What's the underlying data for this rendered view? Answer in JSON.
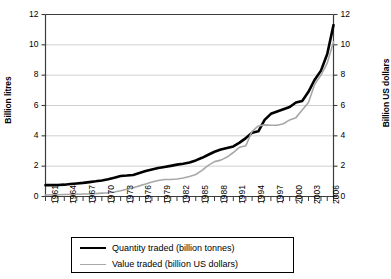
{
  "chart_data": {
    "type": "line",
    "title": "",
    "xlabel": "",
    "ylabel": "Billion litres",
    "ylabel_right": "Billion US dollars",
    "ylim": [
      0,
      12
    ],
    "ylim_right": [
      0,
      12
    ],
    "yticks": [
      0,
      2,
      4,
      6,
      8,
      10,
      12
    ],
    "yticks_right": [
      0,
      2,
      4,
      6,
      8,
      10,
      12
    ],
    "grid": true,
    "grid_axis": "y",
    "legend_position": "bottom",
    "x": [
      1961,
      1962,
      1963,
      1964,
      1965,
      1966,
      1967,
      1968,
      1969,
      1970,
      1971,
      1972,
      1973,
      1974,
      1975,
      1976,
      1977,
      1978,
      1979,
      1980,
      1981,
      1982,
      1983,
      1984,
      1985,
      1986,
      1987,
      1988,
      1989,
      1990,
      1991,
      1992,
      1993,
      1994,
      1995,
      1996,
      1997,
      1998,
      1999,
      2000,
      2001,
      2002,
      2003,
      2004,
      2005,
      2006,
      2007
    ],
    "xtick_labels": [
      "1961",
      "1964",
      "1967",
      "1970",
      "1973",
      "1976",
      "1979",
      "1982",
      "1985",
      "1988",
      "1991",
      "1994",
      "1997",
      "2000",
      "2003",
      "2006"
    ],
    "xtick_years": [
      1961,
      1964,
      1967,
      1970,
      1973,
      1976,
      1979,
      1982,
      1985,
      1988,
      1991,
      1994,
      1997,
      2000,
      2003,
      2006
    ],
    "series": [
      {
        "name": "Quantity traded (billion tonnes)",
        "color": "#000000",
        "width": 2.6,
        "values": [
          0.75,
          0.75,
          0.76,
          0.78,
          0.82,
          0.86,
          0.9,
          0.95,
          1.0,
          1.06,
          1.14,
          1.24,
          1.35,
          1.38,
          1.42,
          1.55,
          1.68,
          1.78,
          1.88,
          1.95,
          2.02,
          2.1,
          2.16,
          2.24,
          2.38,
          2.55,
          2.75,
          2.95,
          3.1,
          3.2,
          3.3,
          3.55,
          3.85,
          4.2,
          4.3,
          5.05,
          5.45,
          5.6,
          5.75,
          5.9,
          6.2,
          6.3,
          6.9,
          7.7,
          8.3,
          9.4,
          11.3
        ]
      },
      {
        "name": "Value traded (billion US dollars)",
        "color": "#a8a8a8",
        "width": 1.6,
        "values": [
          0.1,
          0.11,
          0.12,
          0.13,
          0.14,
          0.15,
          0.16,
          0.17,
          0.19,
          0.22,
          0.25,
          0.3,
          0.38,
          0.48,
          0.58,
          0.7,
          0.82,
          0.95,
          1.05,
          1.12,
          1.12,
          1.15,
          1.22,
          1.32,
          1.45,
          1.72,
          2.05,
          2.3,
          2.4,
          2.6,
          2.9,
          3.25,
          3.35,
          4.3,
          4.65,
          4.72,
          4.7,
          4.7,
          4.8,
          5.05,
          5.2,
          5.7,
          6.2,
          7.4,
          8.0,
          8.8,
          10.2
        ]
      }
    ]
  },
  "legend": {
    "items": [
      {
        "label": "Quantity traded (billion tonnes)"
      },
      {
        "label": "Value traded (billion US dollars)"
      }
    ]
  },
  "colors": {
    "quantity": "#000000",
    "value": "#a8a8a8",
    "grid": "#d0d0d0",
    "axis": "#3c3c3c"
  }
}
